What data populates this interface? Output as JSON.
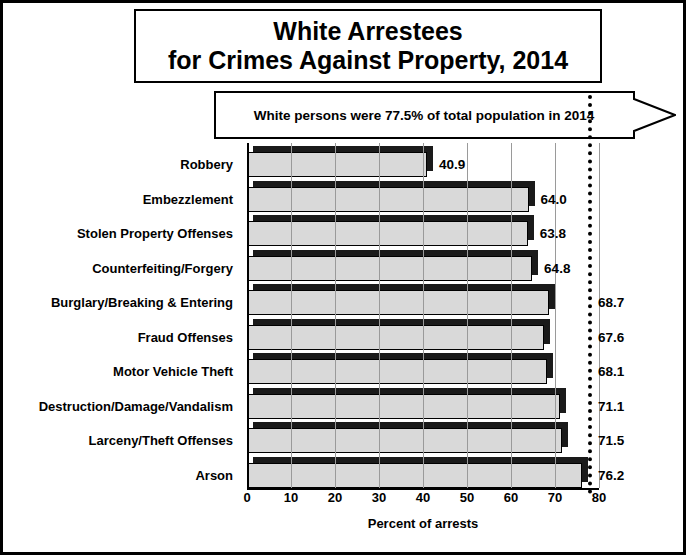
{
  "title": {
    "line1": "White Arrestees",
    "line2": "for Crimes Against Property, 2014"
  },
  "callout": {
    "text": "White persons were 77.5% of total population in 2014",
    "marker_value": 77.5
  },
  "chart_data": {
    "type": "bar",
    "orientation": "horizontal",
    "title": "White Arrestees for Crimes Against Property, 2014",
    "xlabel": "Percent of arrests",
    "ylabel": "",
    "xlim": [
      0,
      80
    ],
    "xticks": [
      0,
      10,
      20,
      30,
      40,
      50,
      60,
      70,
      80
    ],
    "grid": true,
    "legend": "none",
    "annotation": "White persons were 77.5% of total population in 2014",
    "reference_line": 77.5,
    "categories": [
      "Robbery",
      "Embezzlement",
      "Stolen Property Offenses",
      "Counterfeiting/Forgery",
      "Burglary/Breaking & Entering",
      "Fraud Offenses",
      "Motor Vehicle Theft",
      "Destruction/Damage/Vandalism",
      "Larceny/Theft Offenses",
      "Arson"
    ],
    "values": [
      40.9,
      64.0,
      63.8,
      64.8,
      68.7,
      67.6,
      68.1,
      71.1,
      71.5,
      76.2
    ],
    "value_labels": [
      "40.9",
      "64.0",
      "63.8",
      "64.8",
      "68.7",
      "67.6",
      "68.1",
      "71.1",
      "71.5",
      "76.2"
    ]
  }
}
